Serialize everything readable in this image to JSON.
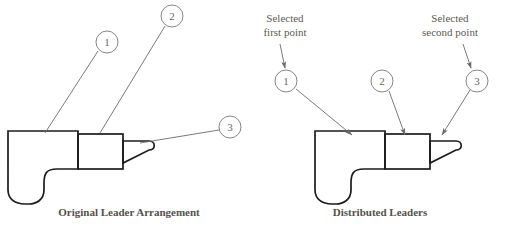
{
  "figure": {
    "background_color": "#ffffff",
    "outline_color": "#1d1c1b",
    "leader_color": "#6e6a67",
    "text_color": "#55514e"
  },
  "panels": [
    {
      "id": "original",
      "caption": "Original Leader Arrangement",
      "leader_style": "converging-no-arrowheads",
      "balloons": [
        {
          "label": "1",
          "cx": 107,
          "cy": 42
        },
        {
          "label": "2",
          "cx": 172,
          "cy": 16
        },
        {
          "label": "3",
          "cx": 230,
          "cy": 127
        }
      ],
      "leaders": [
        {
          "balloon": "1",
          "from_x": 98,
          "from_y": 51,
          "to_x": 45,
          "to_y": 133
        },
        {
          "balloon": "2",
          "from_x": 165,
          "from_y": 26,
          "to_x": 100,
          "to_y": 133
        },
        {
          "balloon": "3",
          "from_x": 219,
          "from_y": 130,
          "to_x": 140,
          "to_y": 143
        }
      ]
    },
    {
      "id": "distributed",
      "caption": "Distributed Leaders",
      "leader_style": "distributed-with-arrowheads",
      "balloons": [
        {
          "label": "1",
          "cx": 286,
          "cy": 81
        },
        {
          "label": "2",
          "cx": 382,
          "cy": 81
        },
        {
          "label": "3",
          "cx": 477,
          "cy": 81
        }
      ],
      "leaders": [
        {
          "balloon": "1",
          "from_x": 296,
          "from_y": 89,
          "to_x": 352,
          "to_y": 135
        },
        {
          "balloon": "2",
          "from_x": 389,
          "from_y": 91,
          "to_x": 405,
          "to_y": 135
        },
        {
          "balloon": "3",
          "from_x": 470,
          "from_y": 90,
          "to_x": 442,
          "to_y": 135
        }
      ],
      "annotations": [
        {
          "name": "selected-first-point",
          "line1": "Selected",
          "line2": "first point",
          "text_x": 285,
          "text_y": 22,
          "arrow_from_x": 280,
          "arrow_from_y": 44,
          "arrow_to_x": 285,
          "arrow_to_y": 68
        },
        {
          "name": "selected-second-point",
          "line1": "Selected",
          "line2": "second point",
          "text_x": 450,
          "text_y": 22,
          "arrow_from_x": 463,
          "arrow_from_y": 44,
          "arrow_to_x": 471,
          "arrow_to_y": 68
        }
      ]
    }
  ],
  "captions": {
    "left": "Original Leader Arrangement",
    "right": "Distributed Leaders",
    "left_x": 129,
    "left_y": 216,
    "right_x": 380,
    "right_y": 216
  },
  "part_profile": {
    "description": "machine part side profile: body with rounded lower-left, mid block, tapered nose",
    "left_origin_x": 8,
    "right_origin_x": 315,
    "top_y": 131
  }
}
